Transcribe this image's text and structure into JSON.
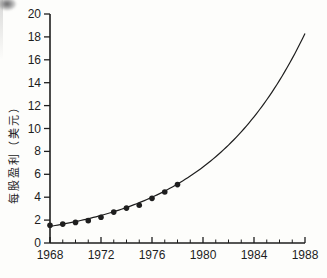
{
  "page": {
    "background_color": "#fdfdfb",
    "ink_color": "#1e1e1e"
  },
  "chart_data": {
    "type": "scatter",
    "title": "",
    "xlabel": "",
    "ylabel": "每股盈利（美元）",
    "xlim": [
      1968,
      1988
    ],
    "ylim": [
      0,
      20
    ],
    "x_major_ticks": [
      1968,
      1972,
      1976,
      1980,
      1984,
      1988
    ],
    "x_minor_tick_step_years": 1,
    "y_ticks": [
      0,
      2,
      4,
      6,
      8,
      10,
      12,
      14,
      16,
      18,
      20
    ],
    "grid": "off",
    "legend": "none",
    "series": [
      {
        "name": "observed-eps-points",
        "type": "scatter",
        "marker": "filled-circle",
        "color": "#1e1e1e",
        "points": [
          [
            1968,
            1.55
          ],
          [
            1969,
            1.65
          ],
          [
            1970,
            1.8
          ],
          [
            1971,
            1.95
          ],
          [
            1972,
            2.25
          ],
          [
            1973,
            2.7
          ],
          [
            1974,
            3.05
          ],
          [
            1975,
            3.3
          ],
          [
            1976,
            3.9
          ],
          [
            1977,
            4.45
          ],
          [
            1978,
            5.1
          ]
        ]
      },
      {
        "name": "fitted-exponential-curve",
        "type": "line",
        "color": "#1e1e1e",
        "model": "exponential",
        "start_point": [
          1968,
          1.45
        ],
        "end_point": [
          1988,
          18.3
        ]
      }
    ]
  }
}
